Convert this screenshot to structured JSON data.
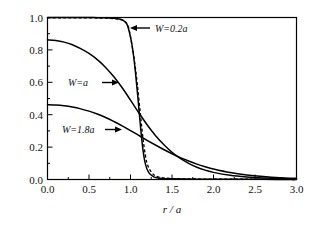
{
  "figure": {
    "background_color": "#ffffff",
    "line_color": "#000000",
    "text_color": "#111111"
  },
  "axes": {
    "x_title": "r / a",
    "y_title_cn": "传输系数",
    "x_ticks": [
      "0.0",
      "0.5",
      "1.0",
      "1.5",
      "2.0",
      "2.5",
      "3.0"
    ],
    "y_ticks": [
      "0.0",
      "0.2",
      "0.4",
      "0.6",
      "0.8",
      "1.0"
    ]
  },
  "annotations": {
    "w02a": "W=0.2a",
    "wa": "W=a",
    "w18a": "W=1.8a"
  },
  "chart_data": {
    "type": "line",
    "title": "",
    "xlabel": "r/a",
    "ylabel": "传输系数",
    "xlim": [
      0.0,
      3.0
    ],
    "ylim": [
      0.0,
      1.0
    ],
    "xticks": [
      0.0,
      0.5,
      1.0,
      1.5,
      2.0,
      2.5,
      3.0
    ],
    "yticks": [
      0.0,
      0.2,
      0.4,
      0.6,
      0.8,
      1.0
    ],
    "grid": false,
    "legend": "inline annotations with arrows",
    "series": [
      {
        "name": "W=0.2a",
        "style": "solid",
        "x": [
          0.0,
          0.1,
          0.2,
          0.3,
          0.4,
          0.5,
          0.6,
          0.7,
          0.8,
          0.85,
          0.9,
          0.93,
          0.96,
          1.0,
          1.03,
          1.06,
          1.09,
          1.12,
          1.15,
          1.18,
          1.22,
          1.28,
          1.35,
          1.5,
          1.8,
          2.2,
          2.6,
          3.0
        ],
        "y": [
          1.0,
          1.0,
          1.0,
          1.0,
          1.0,
          1.0,
          0.999,
          0.998,
          0.995,
          0.992,
          0.985,
          0.975,
          0.955,
          0.88,
          0.79,
          0.66,
          0.5,
          0.33,
          0.185,
          0.095,
          0.042,
          0.016,
          0.008,
          0.004,
          0.002,
          0.001,
          0.001,
          0.0
        ]
      },
      {
        "name": "W=0.2a (overlay)",
        "style": "dashed",
        "x": [
          0.0,
          0.2,
          0.4,
          0.6,
          0.75,
          0.85,
          0.92,
          0.97,
          1.0,
          1.04,
          1.08,
          1.12,
          1.16,
          1.2,
          1.26,
          1.34,
          1.5,
          1.8,
          2.2,
          2.6,
          3.0
        ],
        "y": [
          0.998,
          0.998,
          0.998,
          0.997,
          0.995,
          0.99,
          0.98,
          0.95,
          0.88,
          0.76,
          0.6,
          0.4,
          0.215,
          0.1,
          0.04,
          0.015,
          0.006,
          0.003,
          0.002,
          0.001,
          0.0
        ]
      },
      {
        "name": "W=a",
        "style": "solid",
        "x": [
          0.0,
          0.1,
          0.2,
          0.3,
          0.4,
          0.5,
          0.6,
          0.7,
          0.8,
          0.9,
          1.0,
          1.1,
          1.2,
          1.3,
          1.4,
          1.5,
          1.6,
          1.7,
          1.8,
          1.9,
          2.0,
          2.2,
          2.4,
          2.6,
          2.8,
          3.0
        ],
        "y": [
          0.862,
          0.858,
          0.848,
          0.832,
          0.808,
          0.778,
          0.74,
          0.692,
          0.634,
          0.566,
          0.49,
          0.412,
          0.338,
          0.272,
          0.216,
          0.168,
          0.13,
          0.1,
          0.076,
          0.058,
          0.044,
          0.026,
          0.016,
          0.01,
          0.006,
          0.004
        ]
      },
      {
        "name": "W=1.8a",
        "style": "solid",
        "x": [
          0.0,
          0.1,
          0.2,
          0.3,
          0.4,
          0.5,
          0.6,
          0.7,
          0.8,
          0.9,
          1.0,
          1.1,
          1.2,
          1.3,
          1.4,
          1.5,
          1.6,
          1.7,
          1.8,
          1.9,
          2.0,
          2.2,
          2.4,
          2.6,
          2.8,
          3.0
        ],
        "y": [
          0.462,
          0.46,
          0.455,
          0.447,
          0.436,
          0.422,
          0.404,
          0.383,
          0.358,
          0.331,
          0.302,
          0.272,
          0.242,
          0.213,
          0.185,
          0.159,
          0.135,
          0.114,
          0.095,
          0.079,
          0.065,
          0.043,
          0.028,
          0.018,
          0.011,
          0.007
        ]
      }
    ]
  }
}
